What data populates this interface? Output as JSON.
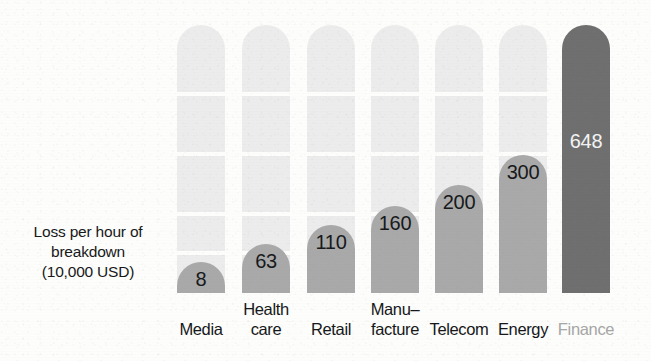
{
  "axis_caption": {
    "lines": [
      "Loss per hour of",
      "breakdown",
      "(10,000 USD)"
    ]
  },
  "colors": {
    "background": "#fdfdfb",
    "bar_fill": "#a9a9a9",
    "bar_fill_highlight": "#6f6f6f",
    "bar_track": "#ececec",
    "label_text": "#15171a",
    "label_text_muted": "#a6a6a6",
    "value_text": "#17191b",
    "value_text_light": "#f4f4f4"
  },
  "chart_data": {
    "type": "bar",
    "title": "",
    "subtitle": "",
    "xlabel": "",
    "ylabel": "Loss per hour of breakdown (10,000 USD)",
    "ylim": [
      0,
      648
    ],
    "grid": true,
    "legend": "none",
    "orientation": "vertical",
    "categories": [
      "Media",
      "Health care",
      "Retail",
      "Manu-facture",
      "Telecom",
      "Energy",
      "Finance"
    ],
    "category_lines": [
      [
        "Media"
      ],
      [
        "Health",
        "care"
      ],
      [
        "Retail"
      ],
      [
        "Manu–",
        "facture"
      ],
      [
        "Telecom"
      ],
      [
        "Energy"
      ],
      [
        "Finance"
      ]
    ],
    "values": [
      8,
      63,
      110,
      160,
      200,
      300,
      648
    ],
    "value_labels": [
      "8",
      "63",
      "110",
      "160",
      "200",
      "300",
      "648"
    ],
    "highlight_index": 6,
    "units": "10,000 USD"
  },
  "bars": [
    {
      "label": "Media",
      "value_label": "8",
      "lines": [
        "Media"
      ],
      "left": 177,
      "width": 48,
      "fill_height": 31,
      "value_top": 268,
      "dark": false,
      "muted_label": false
    },
    {
      "label": "Health care",
      "value_label": "63",
      "lines": [
        "Health",
        "care"
      ],
      "left": 242,
      "width": 48,
      "fill_height": 49,
      "value_top": 250,
      "dark": false,
      "muted_label": false
    },
    {
      "label": "Retail",
      "value_label": "110",
      "lines": [
        "Retail"
      ],
      "left": 307,
      "width": 48,
      "fill_height": 68,
      "value_top": 231,
      "dark": false,
      "muted_label": false
    },
    {
      "label": "Manu-facture",
      "value_label": "160",
      "lines": [
        "Manu–",
        "facture"
      ],
      "left": 371,
      "width": 48,
      "fill_height": 87,
      "value_top": 212,
      "dark": false,
      "muted_label": false
    },
    {
      "label": "Telecom",
      "value_label": "200",
      "lines": [
        "Telecom"
      ],
      "left": 435,
      "width": 48,
      "fill_height": 108,
      "value_top": 191,
      "dark": false,
      "muted_label": false
    },
    {
      "label": "Energy",
      "value_label": "300",
      "lines": [
        "Energy"
      ],
      "left": 499,
      "width": 48,
      "fill_height": 138,
      "value_top": 161,
      "dark": false,
      "muted_label": false
    },
    {
      "label": "Finance",
      "value_label": "648",
      "lines": [
        "Finance"
      ],
      "left": 562,
      "width": 48,
      "fill_height": 268,
      "value_top": 130,
      "dark": true,
      "muted_label": true
    }
  ],
  "track": {
    "height": 268,
    "grid_gap_offsets": [
      92,
      152,
      212,
      251
    ]
  }
}
